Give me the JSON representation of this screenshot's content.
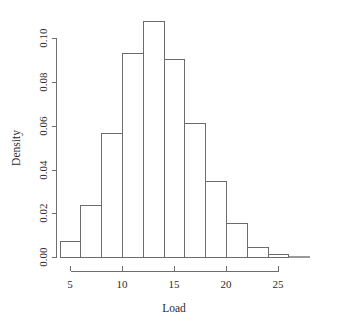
{
  "chart_data": {
    "type": "bar",
    "title": "",
    "subtitle": "",
    "xlabel": "Load",
    "ylabel": "Density",
    "grid": false,
    "legend": false,
    "legend_position": "none",
    "histogram": true,
    "bin_width": 2,
    "bin_edges": [
      4,
      6,
      8,
      10,
      12,
      14,
      16,
      18,
      20,
      22,
      24,
      26,
      28
    ],
    "categories": [
      "4-6",
      "6-8",
      "8-10",
      "10-12",
      "12-14",
      "14-16",
      "16-18",
      "18-20",
      "20-22",
      "22-24",
      "24-26",
      "26-28"
    ],
    "values": [
      0.0073,
      0.0238,
      0.0566,
      0.0931,
      0.1076,
      0.0906,
      0.0612,
      0.0347,
      0.0153,
      0.0044,
      0.0012,
      0.0
    ],
    "xlim": [
      4,
      28
    ],
    "ylim": [
      0.0,
      0.108
    ],
    "xticks": [
      5,
      10,
      15,
      20,
      25
    ],
    "xtick_labels": [
      "5",
      "10",
      "15",
      "20",
      "25"
    ],
    "yticks": [
      0.0,
      0.02,
      0.04,
      0.06,
      0.08,
      0.1
    ],
    "ytick_labels": [
      "0.00",
      "0.02",
      "0.04",
      "0.06",
      "0.08",
      "0.10"
    ],
    "colors": {
      "bar_fill": "#ffffff",
      "bar_stroke": "#6b6b6b",
      "axis": "#6e6e6e",
      "text": "#2b2b2b",
      "background": "#ffffff"
    }
  }
}
